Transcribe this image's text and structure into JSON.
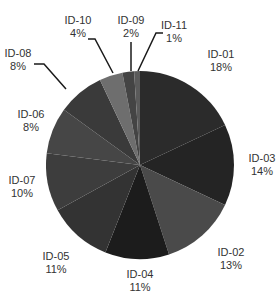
{
  "chart_data": {
    "type": "pie",
    "title": "",
    "slices": [
      {
        "label": "ID-01",
        "value": 18,
        "display": "18%",
        "color": "#2b2b2b"
      },
      {
        "label": "ID-03",
        "value": 14,
        "display": "14%",
        "color": "#242424"
      },
      {
        "label": "ID-02",
        "value": 13,
        "display": "13%",
        "color": "#4a4a4a"
      },
      {
        "label": "ID-04",
        "value": 11,
        "display": "11%",
        "color": "#1c1c1c"
      },
      {
        "label": "ID-05",
        "value": 11,
        "display": "11%",
        "color": "#333333"
      },
      {
        "label": "ID-07",
        "value": 10,
        "display": "10%",
        "color": "#3d3d3d"
      },
      {
        "label": "ID-06",
        "value": 8,
        "display": "8%",
        "color": "#464646"
      },
      {
        "label": "ID-08",
        "value": 8,
        "display": "8%",
        "color": "#3a3a3a"
      },
      {
        "label": "ID-10",
        "value": 4,
        "display": "4%",
        "color": "#6e6e6e"
      },
      {
        "label": "ID-09",
        "value": 2,
        "display": "2%",
        "color": "#444444"
      },
      {
        "label": "ID-11",
        "value": 1,
        "display": "1%",
        "color": "#5a5a5a"
      }
    ],
    "start_angle_deg": 0,
    "direction": "clockwise",
    "legend": "none",
    "labels": "outside with leader lines for small slices"
  },
  "labels": {
    "id01": {
      "name": "ID-01",
      "pct": "18%"
    },
    "id03": {
      "name": "ID-03",
      "pct": "14%"
    },
    "id02": {
      "name": "ID-02",
      "pct": "13%"
    },
    "id04": {
      "name": "ID-04",
      "pct": "11%"
    },
    "id05": {
      "name": "ID-05",
      "pct": "11%"
    },
    "id07": {
      "name": "ID-07",
      "pct": "10%"
    },
    "id06": {
      "name": "ID-06",
      "pct": "8%"
    },
    "id08": {
      "name": "ID-08",
      "pct": "8%"
    },
    "id10": {
      "name": "ID-10",
      "pct": "4%"
    },
    "id09": {
      "name": "ID-09",
      "pct": "2%"
    },
    "id11": {
      "name": "ID-11",
      "pct": "1%"
    }
  }
}
